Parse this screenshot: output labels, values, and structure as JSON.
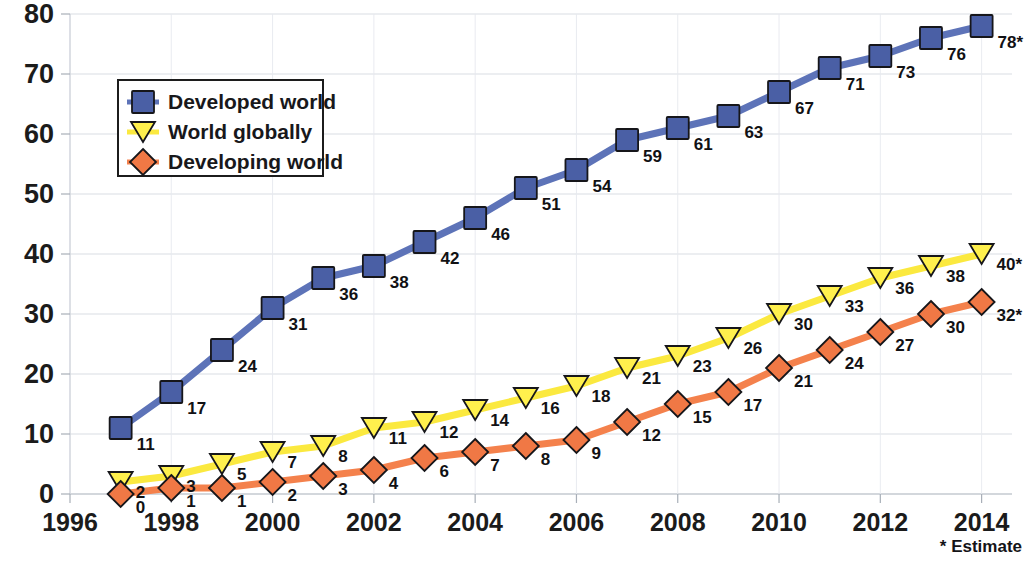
{
  "chart_data": {
    "type": "line",
    "title": "",
    "subtitle": "",
    "xlabel": "",
    "ylabel": "",
    "xlim": [
      1996,
      2014.6
    ],
    "ylim": [
      0,
      80
    ],
    "grid": true,
    "grid_axis": "y",
    "legend_position": "upper-left-inside",
    "x": [
      1997,
      1998,
      1999,
      2000,
      2001,
      2002,
      2003,
      2004,
      2005,
      2006,
      2007,
      2008,
      2009,
      2010,
      2011,
      2012,
      2013,
      2014
    ],
    "xticks": [
      1996,
      1998,
      2000,
      2002,
      2004,
      2006,
      2008,
      2010,
      2012,
      2014
    ],
    "xtick_labels": [
      "1996",
      "1998",
      "2000",
      "2002",
      "2004",
      "2006",
      "2008",
      "2010",
      "2012",
      "2014"
    ],
    "yticks": [
      0,
      10,
      20,
      30,
      40,
      50,
      60,
      70,
      80
    ],
    "ytick_labels": [
      "0",
      "10",
      "20",
      "30",
      "40",
      "50",
      "60",
      "70",
      "80"
    ],
    "series": [
      {
        "name": "Developed world",
        "color": "#4a5fa5",
        "line_color": "#5d73b8",
        "marker": "square",
        "values": [
          11,
          17,
          24,
          31,
          36,
          38,
          42,
          46,
          51,
          54,
          59,
          61,
          63,
          67,
          71,
          73,
          76,
          78
        ],
        "labels": [
          "11",
          "17",
          "24",
          "31",
          "36",
          "38",
          "42",
          "46",
          "51",
          "54",
          "59",
          "61",
          "63",
          "67",
          "71",
          "73",
          "76",
          "78*"
        ]
      },
      {
        "name": "World globally",
        "color": "#fff04d",
        "line_color": "#fbe93f",
        "marker": "triangle-down",
        "values": [
          2,
          3,
          5,
          7,
          8,
          11,
          12,
          14,
          16,
          18,
          21,
          23,
          26,
          30,
          33,
          36,
          38,
          40
        ],
        "labels": [
          "2",
          "3",
          "5",
          "7",
          "8",
          "11",
          "12",
          "14",
          "16",
          "18",
          "21",
          "23",
          "26",
          "30",
          "33",
          "36",
          "38",
          "40*"
        ]
      },
      {
        "name": "Developing world",
        "color": "#f07845",
        "line_color": "#f4814c",
        "marker": "diamond",
        "values": [
          0,
          1,
          1,
          2,
          3,
          4,
          6,
          7,
          8,
          9,
          12,
          15,
          17,
          21,
          24,
          27,
          30,
          32
        ],
        "labels": [
          "0",
          "1",
          "1",
          "2",
          "3",
          "4",
          "6",
          "7",
          "8",
          "9",
          "12",
          "15",
          "17",
          "21",
          "24",
          "27",
          "30",
          "32*"
        ]
      }
    ],
    "annotations": [
      {
        "text": "* Estimate",
        "position": "bottom-right"
      }
    ]
  },
  "legend": {
    "items": [
      {
        "label": "Developed world"
      },
      {
        "label": "World globally"
      },
      {
        "label": "Developing world"
      }
    ]
  },
  "footnote": {
    "text": "* Estimate"
  }
}
